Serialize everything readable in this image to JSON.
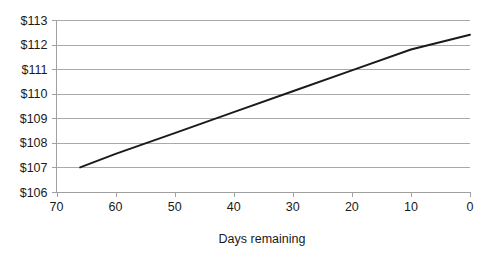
{
  "chart_data": {
    "type": "line",
    "title": "",
    "subtitle": "",
    "xlabel": "Days remaining",
    "ylabel": "",
    "x": [
      66,
      60,
      50,
      40,
      30,
      20,
      10,
      0
    ],
    "series": [
      {
        "name": "Price",
        "values": [
          107.0,
          107.55,
          108.4,
          109.25,
          110.1,
          110.95,
          111.8,
          112.4
        ]
      }
    ],
    "xlim": [
      70,
      0
    ],
    "ylim": [
      106,
      113
    ],
    "x_reversed": true,
    "xticks": [
      70,
      60,
      50,
      40,
      30,
      20,
      10,
      0
    ],
    "xticklabels": [
      "70",
      "60",
      "50",
      "40",
      "30",
      "20",
      "10",
      "0"
    ],
    "yticks": [
      106,
      107,
      108,
      109,
      110,
      111,
      112,
      113
    ],
    "yticklabels": [
      "$106",
      "$107",
      "$108",
      "$109",
      "$110",
      "$111",
      "$112",
      "$113"
    ],
    "grid": "horizontal",
    "legend": "none",
    "annotations": [],
    "line_color": "#1a1a1a",
    "grid_color": "#a9a9a9",
    "background_color": "#ffffff",
    "endpoints": {
      "start": {
        "x": 66,
        "y": 107.0
      },
      "end": {
        "x": 0,
        "y": 112.4
      }
    }
  }
}
